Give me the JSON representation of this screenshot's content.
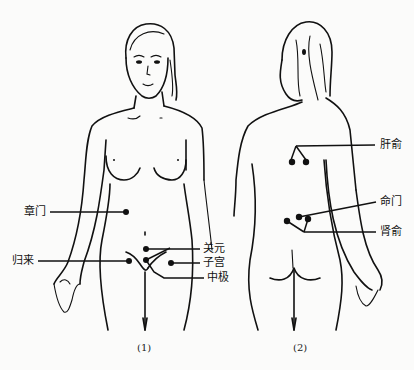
{
  "figure": {
    "panels": [
      {
        "id": "front",
        "caption": "(1)",
        "view": "front view of female figure",
        "acupoints": [
          {
            "name": "章门",
            "side": "left"
          },
          {
            "name": "归来",
            "side": "left"
          },
          {
            "name": "关元",
            "side": "right"
          },
          {
            "name": "子宫",
            "side": "right"
          },
          {
            "name": "中极",
            "side": "right"
          }
        ]
      },
      {
        "id": "back",
        "caption": "(2)",
        "view": "back view of female figure",
        "acupoints": [
          {
            "name": "肝俞",
            "side": "right"
          },
          {
            "name": "命门",
            "side": "right"
          },
          {
            "name": "肾俞",
            "side": "right"
          }
        ]
      }
    ],
    "colors": {
      "background": "#fbfbfa",
      "ink": "#111111"
    }
  }
}
